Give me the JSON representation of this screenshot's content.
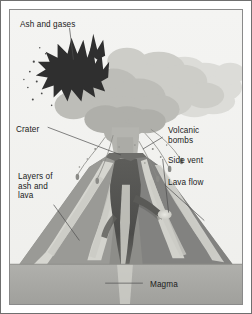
{
  "figure": {
    "type": "labelled-diagram",
    "background_color": "#f2f2f0",
    "border_color": "#6f6f6f",
    "text_color": "#1b1b1b"
  },
  "labels": {
    "ash_and_gases": "Ash and gases",
    "crater": "Crater",
    "layers_of_ash_and_lava": "Layers of\nash and\nlava",
    "volcanic_bombs": "Volcanic\nbombs",
    "side_vent": "Side vent",
    "lava_flow": "Lava flow",
    "magma": "Magma"
  },
  "parts": [
    {
      "name": "ash-plume",
      "label": "Ash and gases",
      "color": "#2d2d2d"
    },
    {
      "name": "eruption-cloud",
      "label": "Ash and gases",
      "color": "#b8b8b4"
    },
    {
      "name": "crater",
      "label": "Crater",
      "color": "#6b6b6b"
    },
    {
      "name": "volcanic-bombs",
      "label": "Volcanic bombs",
      "color": "#8c8c8c"
    },
    {
      "name": "side-vent",
      "label": "Side vent",
      "color": "#5a5a5a"
    },
    {
      "name": "lava-flow",
      "label": "Lava flow",
      "color": "#d8d8d2"
    },
    {
      "name": "layers-of-ash-and-lava",
      "label": "Layers of ash and lava",
      "color": "#9a9a96"
    },
    {
      "name": "magma-chamber",
      "label": "Magma",
      "color": "#a9a9a5"
    },
    {
      "name": "central-conduit",
      "label": "Central conduit",
      "color": "#4a4a4a"
    }
  ],
  "palette": {
    "cloud_light": "#d5d5d1",
    "cloud_mid": "#c2c2bd",
    "cloud_dark": "#adada8",
    "plume_dark": "#2d2d2d",
    "cone_dark": "#6f6f6c",
    "cone_mid": "#8f8f8b",
    "cone_light": "#d6d6d0",
    "conduit": "#4f4f4d",
    "magma_band": "#a8a8a4",
    "leader_line": "#555555"
  }
}
